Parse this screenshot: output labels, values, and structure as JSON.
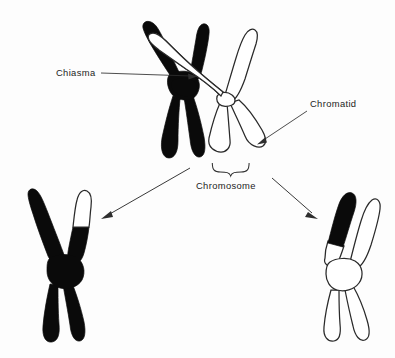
{
  "figure": {
    "background_color": "#fdfdfd",
    "ink_color": "#0a0a0a",
    "outline_color": "#2a2a2a"
  },
  "labels": {
    "chiasma": "Chiasma",
    "chiasma_dash": "—",
    "chromatid": "Chromatid",
    "chromosome": "Chromosome"
  },
  "structures": {
    "top_black_chromosome": {
      "name": "black-chromosome",
      "fill": "black",
      "description": "Darkly stained X-shaped chromosome with two upper arms and two lower legs"
    },
    "top_white_chromosome": {
      "name": "white-chromosome",
      "fill": "white-outline",
      "description": "Unstained outlined X-shaped chromosome overlapping the black one at the chiasma"
    },
    "result_left_chromosome": {
      "name": "recombinant-chromosome-left",
      "fill": "black",
      "tip": "white",
      "description": "Mostly black recombinant chromosome with a white segment at the tip of its upper right arm"
    },
    "result_right_chromosome": {
      "name": "recombinant-chromosome-right",
      "fill": "white-outline",
      "tip": "black",
      "description": "Outlined recombinant chromosome with a black segment at the tip of its upper left arm"
    }
  },
  "annotations": {
    "chiasma_pointer": "leader line from Chiasma label to the crossover point",
    "chromatid_pointer": "leader line from Chromatid label to a white chromatid arm",
    "chromosome_brace": "curly brace grouping the two legs of the white chromosome",
    "left_result_arrow": "arrow from the paired chromosomes to the left recombinant product",
    "right_result_arrow": "arrow from the paired chromosomes to the right recombinant product"
  }
}
